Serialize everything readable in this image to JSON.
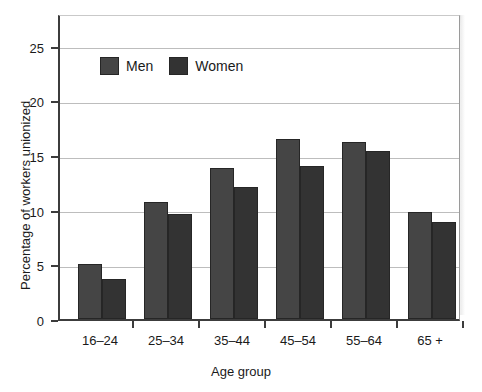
{
  "chart_data": {
    "type": "bar",
    "title": "",
    "subtitle": "",
    "xlabel": "Age group",
    "ylabel": "Percentage of workers unionized",
    "categories": [
      "16–24",
      "25–34",
      "35–44",
      "45–54",
      "55–64",
      "65 +"
    ],
    "series": [
      {
        "name": "Men",
        "color": "#454545",
        "values": [
          5.0,
          10.7,
          13.8,
          16.5,
          16.2,
          9.8
        ]
      },
      {
        "name": "Women",
        "color": "#333333",
        "values": [
          3.7,
          9.6,
          12.1,
          14.0,
          15.4,
          8.9
        ]
      }
    ],
    "ylim": [
      0,
      28
    ],
    "yticks": [
      0,
      5,
      10,
      15,
      20,
      25
    ],
    "ytick_labels": [
      "0",
      "5",
      "10",
      "15",
      "20",
      "25"
    ],
    "grid": "horizontal",
    "legend_position": "top-left-inside"
  },
  "legend": {
    "entries": [
      {
        "label": "Men",
        "swatch": "men-swatch"
      },
      {
        "label": "Women",
        "swatch": "women-swatch"
      }
    ]
  },
  "colors": {
    "men": "#454545",
    "women": "#333333",
    "axis": "#3c3c3c",
    "grid": "#bdbdbd",
    "background": "#ffffff"
  }
}
